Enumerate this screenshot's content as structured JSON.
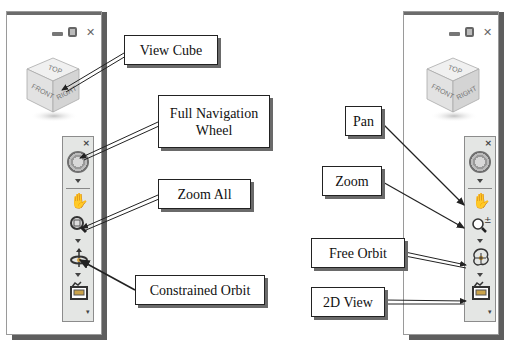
{
  "left_panel": {
    "window_controls": {
      "minimize": "minimize-icon",
      "restore": "restore-icon",
      "close": "close-icon"
    },
    "view_cube": {
      "faces": {
        "top": "TOP",
        "front": "FRONT",
        "right": "RIGHT"
      }
    },
    "navigation_bar": {
      "close_glyph": "×",
      "tools": [
        "full-navigation-wheel",
        "pan",
        "zoom-all",
        "constrained-orbit",
        "2d-view"
      ],
      "customize_glyph": "▾"
    }
  },
  "right_panel": {
    "window_controls": {
      "minimize": "minimize-icon",
      "restore": "restore-icon",
      "close": "close-icon"
    },
    "view_cube": {
      "faces": {
        "top": "TOP",
        "front": "FRONT",
        "right": "RIGHT"
      }
    },
    "navigation_bar": {
      "close_glyph": "×",
      "tools": [
        "full-navigation-wheel",
        "pan",
        "zoom",
        "free-orbit",
        "2d-view"
      ],
      "customize_glyph": "▾"
    }
  },
  "callouts_left": [
    {
      "id": "view-cube",
      "label": "View Cube"
    },
    {
      "id": "full-navigation-wheel",
      "label_line1": "Full Navigation",
      "label_line2": "Wheel"
    },
    {
      "id": "zoom-all",
      "label": "Zoom All"
    },
    {
      "id": "constrained-orbit",
      "label": "Constrained Orbit"
    }
  ],
  "callouts_right": [
    {
      "id": "pan",
      "label": "Pan"
    },
    {
      "id": "zoom",
      "label": "Zoom"
    },
    {
      "id": "free-orbit",
      "label": "Free Orbit"
    },
    {
      "id": "2d-view",
      "label": "2D View"
    }
  ],
  "glyphs": {
    "pan": "✋",
    "zoom_all": "🔍",
    "zoom_pm": "±",
    "close": "✕"
  }
}
